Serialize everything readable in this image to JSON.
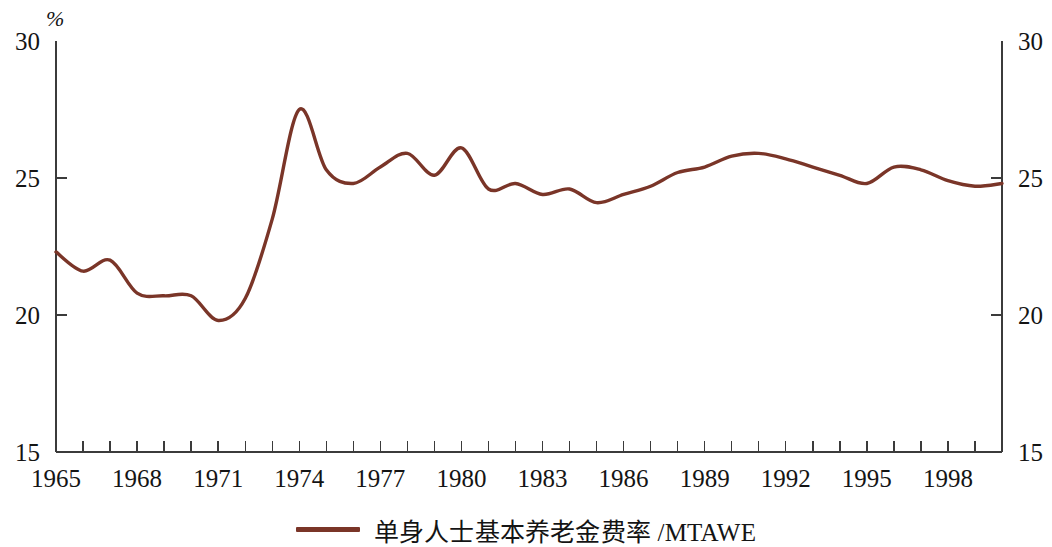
{
  "axes": {
    "unit_label": "%",
    "y_left_ticks": [
      "30",
      "25",
      "20",
      "15"
    ],
    "y_right_ticks": [
      "30",
      "25",
      "20",
      "15"
    ],
    "x_ticks": [
      "1965",
      "1968",
      "1971",
      "1974",
      "1977",
      "1980",
      "1983",
      "1986",
      "1989",
      "1992",
      "1995",
      "1998"
    ]
  },
  "legend": {
    "label": "单身人士基本养老金费率 /MTAWE",
    "color": "#7a3528"
  },
  "chart_data": {
    "type": "line",
    "title": "",
    "subtitle": "",
    "xlabel": "",
    "ylabel": "%",
    "xlim": [
      1965,
      2000
    ],
    "ylim": [
      15,
      30
    ],
    "y_ticks": [
      15,
      20,
      25,
      30
    ],
    "x_ticks": [
      1965,
      1968,
      1971,
      1974,
      1977,
      1980,
      1983,
      1986,
      1989,
      1992,
      1995,
      1998
    ],
    "x_minor_tick_interval": 1,
    "grid": false,
    "legend_position": "bottom-center",
    "series": [
      {
        "name": "单身人士基本养老金费率 /MTAWE",
        "color": "#7a3528",
        "x": [
          1965,
          1966,
          1967,
          1968,
          1969,
          1970,
          1971,
          1972,
          1973,
          1974,
          1975,
          1976,
          1977,
          1978,
          1979,
          1980,
          1981,
          1982,
          1983,
          1984,
          1985,
          1986,
          1987,
          1988,
          1989,
          1990,
          1991,
          1992,
          1993,
          1994,
          1995,
          1996,
          1997,
          1998,
          1999,
          2000
        ],
        "values": [
          22.3,
          21.6,
          22.0,
          20.8,
          20.7,
          20.7,
          19.8,
          20.6,
          23.5,
          27.5,
          25.3,
          24.8,
          25.4,
          25.9,
          25.1,
          26.1,
          24.6,
          24.8,
          24.4,
          24.6,
          24.1,
          24.4,
          24.7,
          25.2,
          25.4,
          25.8,
          25.9,
          25.7,
          25.4,
          25.1,
          24.8,
          25.4,
          25.3,
          24.9,
          24.7,
          24.8
        ]
      }
    ]
  }
}
